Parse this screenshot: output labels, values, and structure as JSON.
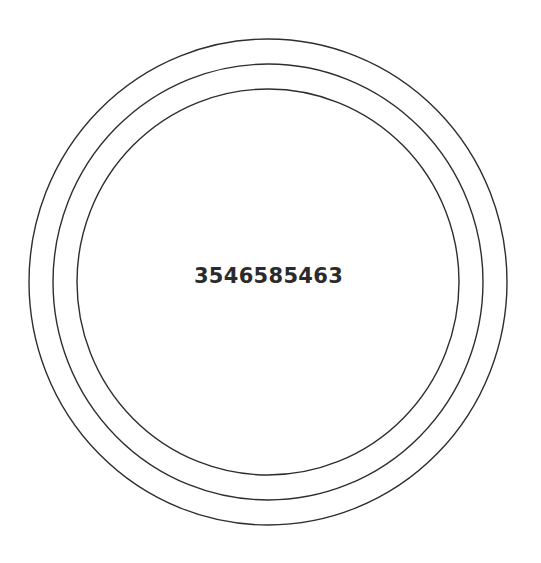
{
  "center_text": "3546585463",
  "colors": {
    "background": "#ffffff",
    "ring_stroke": "#2e2e2e",
    "text": "#2b2b2b"
  },
  "rings": [
    {
      "name": "outer",
      "cx": 268,
      "cy": 282,
      "rx": 239,
      "ry": 243
    },
    {
      "name": "middle",
      "cx": 268,
      "cy": 282,
      "rx": 215,
      "ry": 218
    },
    {
      "name": "inner",
      "cx": 268,
      "cy": 282,
      "rx": 191,
      "ry": 193
    }
  ]
}
